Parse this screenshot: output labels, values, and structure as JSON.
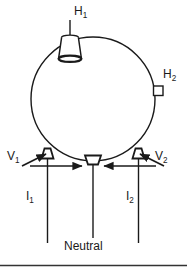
{
  "figure": {
    "kind": "single-phase-transformer-schematic",
    "stroke_color": "#1a1a1a",
    "background_color": "#ffffff",
    "footer_rule_color": "#333333"
  },
  "labels": {
    "h1": {
      "base": "H",
      "sub": "1",
      "text": "H1"
    },
    "h2": {
      "base": "H",
      "sub": "2",
      "text": "H2"
    },
    "v1": {
      "base": "V",
      "sub": "1",
      "text": "V1"
    },
    "v2": {
      "base": "V",
      "sub": "2",
      "text": "V2"
    },
    "i1": {
      "base": "I",
      "sub": "1",
      "text": "I1"
    },
    "i2": {
      "base": "I",
      "sub": "2",
      "text": "I2"
    },
    "neutral": "Neutral"
  },
  "parts": {
    "tank": "transformer-tank-ellipse",
    "bushing_h1": "high-voltage-bushing-h1",
    "bushing_h2": "high-voltage-bushing-h2",
    "bushing_left": "low-voltage-bushing-left",
    "bushing_center": "low-voltage-bushing-neutral",
    "bushing_right": "low-voltage-bushing-right",
    "lead_left": "conductor-lead-left",
    "lead_center": "conductor-lead-neutral",
    "lead_right": "conductor-lead-right",
    "arrow_v1_outer": "voltage-arrow-v1-outer",
    "arrow_v1_inner": "voltage-arrow-v1-inner",
    "arrow_v2_outer": "voltage-arrow-v2-outer",
    "arrow_v2_inner": "voltage-arrow-v2-inner"
  }
}
